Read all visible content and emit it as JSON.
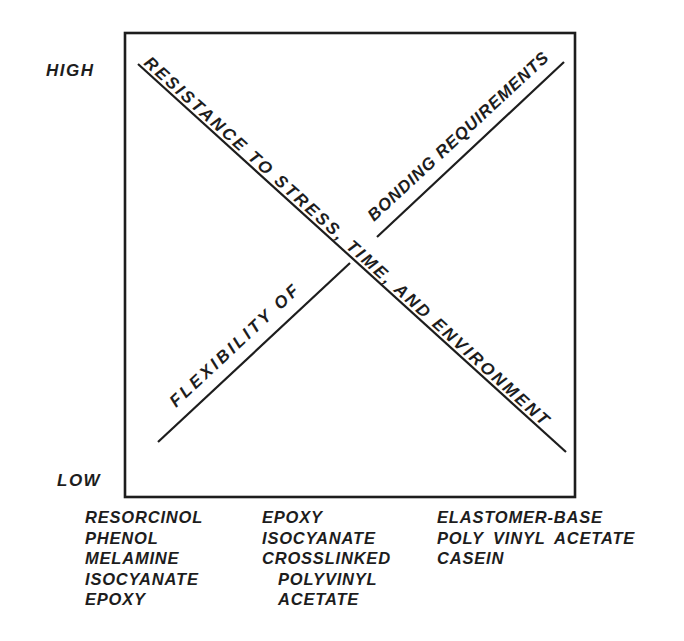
{
  "diagram": {
    "high_label": "HIGH",
    "low_label": "LOW",
    "resistance_label": "RESISTANCE TO STRESS, TIME, AND ENVIRONMENT",
    "flexibility_label_line1": "FLEXIBILITY OF",
    "flexibility_label_line2": "BONDING REQUIREMENTS",
    "ink_color": "#1d1d1d",
    "background_color": "#ffffff"
  },
  "adhesive_columns": [
    {
      "items": [
        "RESORCINOL",
        "PHENOL",
        "MELAMINE",
        "ISOCYANATE",
        "EPOXY"
      ]
    },
    {
      "items": [
        "EPOXY",
        "ISOCYANATE",
        "CROSSLINKED",
        "POLYVINYL",
        "ACETATE"
      ]
    },
    {
      "items": [
        "ELASTOMER-BASE",
        "POLY VINYL ACETATE",
        "CASEIN"
      ]
    }
  ]
}
